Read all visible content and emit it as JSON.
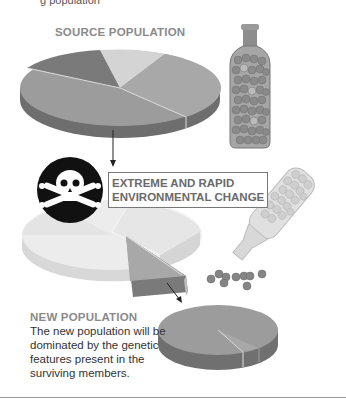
{
  "header": {
    "cut_text": "g population"
  },
  "source": {
    "title": "SOURCE POPULATION"
  },
  "event": {
    "line1": "EXTREME AND RAPID",
    "line2": "ENVIRONMENTAL CHANGE",
    "icon": "skull-crossbones-icon"
  },
  "result": {
    "title": "NEW POPULATION",
    "description": "The new population will be dominated by the genetic features present in the surviving members."
  },
  "colors": {
    "background": "#ffffff",
    "pie_dark": "#7a7a7a",
    "pie_mid": "#9e9e9e",
    "pie_light": "#cfcfcf",
    "title_gray": "#8a8a8a"
  }
}
